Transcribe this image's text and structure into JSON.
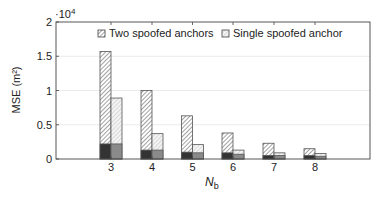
{
  "chart_data": {
    "type": "bar",
    "subtype": "grouped-stacked",
    "title": "",
    "xlabel": "N_b",
    "ylabel": "MSE (m²)",
    "y_multiplier_label": "×10^4",
    "y_multiplier": 10000,
    "ylim": [
      0,
      2
    ],
    "yticks": [
      0,
      0.5,
      1,
      1.5,
      2
    ],
    "ytick_labels": [
      "0",
      "0.5",
      "1",
      "1.5",
      "2"
    ],
    "grid": true,
    "legend_position": "top-inside",
    "categories": [
      "3",
      "4",
      "5",
      "6",
      "7",
      "8"
    ],
    "series": [
      {
        "name": "Two spoofed anchors",
        "pattern": "dense-hatch",
        "total": [
          1.57,
          1.0,
          0.63,
          0.38,
          0.23,
          0.15
        ],
        "lower_part": [
          0.22,
          0.13,
          0.1,
          0.09,
          0.05,
          0.05
        ],
        "lower_color": "#333333"
      },
      {
        "name": "Single spoofed anchor",
        "pattern": "light-hatch",
        "total": [
          0.89,
          0.37,
          0.21,
          0.13,
          0.09,
          0.08
        ],
        "lower_part": [
          0.22,
          0.13,
          0.09,
          0.07,
          0.05,
          0.04
        ],
        "lower_color": "#8a8a8a"
      }
    ]
  },
  "legend": {
    "items": [
      "Two spoofed anchors",
      "Single spoofed anchor"
    ]
  },
  "axes": {
    "xlabel_main": "N",
    "xlabel_sub": "b",
    "ylabel": "MSE (m²)",
    "multiplier_base": "·10",
    "multiplier_exp": "4"
  }
}
